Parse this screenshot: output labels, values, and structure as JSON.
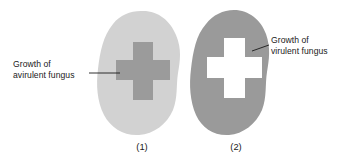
{
  "figure": {
    "type": "biology-diagram",
    "background_color": "#ffffff"
  },
  "panels": [
    {
      "id": "panel-1",
      "caption": "(1)",
      "blob_fill": "#d2d2d2",
      "cross_fill": "#9b9b9b",
      "cross_style": "dark-filled",
      "callout": {
        "line1": "Growth of",
        "line2": "avirulent fungus",
        "position": "left",
        "leader_color": "#1a1a1a"
      }
    },
    {
      "id": "panel-2",
      "caption": "(2)",
      "blob_fill": "#9a9a9a",
      "cross_fill": "#ffffff",
      "cross_style": "white-cutout",
      "callout": {
        "line1": "Growth of",
        "line2": "virulent fungus",
        "position": "right",
        "leader_color": "#1a1a1a"
      }
    }
  ]
}
